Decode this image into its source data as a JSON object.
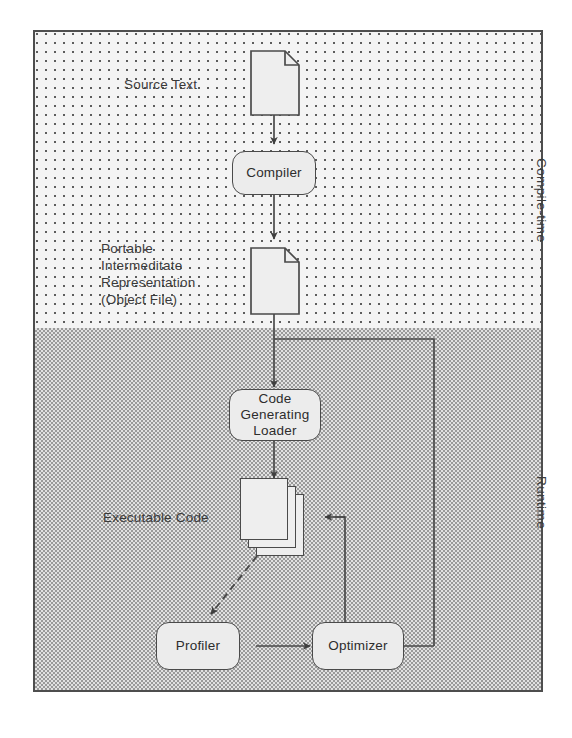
{
  "diagram": {
    "bands": [
      {
        "id": "compile",
        "label": "Compile-time",
        "fill": "#f4f4f4",
        "pattern": "sparse-dots"
      },
      {
        "id": "runtime",
        "label": "Runtime",
        "fill": "#c9c9c9",
        "pattern": "dense-checker"
      }
    ],
    "nodes": [
      {
        "id": "source-text",
        "label": "Source Text",
        "shape": "document"
      },
      {
        "id": "compiler",
        "label": "Compiler",
        "shape": "rounded-box"
      },
      {
        "id": "pir",
        "label": "Portable\nIntermeditate\nRepresentation\n(Object File)",
        "shape": "document"
      },
      {
        "id": "code-gen-loader",
        "label": "Code\nGenerating\nLoader",
        "shape": "rounded-box"
      },
      {
        "id": "executable-code",
        "label": "Executable Code",
        "shape": "page-stack"
      },
      {
        "id": "profiler",
        "label": "Profiler",
        "shape": "rounded-box"
      },
      {
        "id": "optimizer",
        "label": "Optimizer",
        "shape": "rounded-box"
      }
    ],
    "edges": [
      {
        "from": "source-text",
        "to": "compiler",
        "style": "solid"
      },
      {
        "from": "compiler",
        "to": "pir",
        "style": "solid"
      },
      {
        "from": "pir",
        "to": "code-gen-loader",
        "style": "solid"
      },
      {
        "from": "pir",
        "to": "optimizer",
        "style": "solid"
      },
      {
        "from": "code-gen-loader",
        "to": "executable-code",
        "style": "solid"
      },
      {
        "from": "executable-code",
        "to": "profiler",
        "style": "dashed"
      },
      {
        "from": "profiler",
        "to": "optimizer",
        "style": "solid"
      },
      {
        "from": "optimizer",
        "to": "executable-code",
        "style": "solid"
      }
    ],
    "colors": {
      "stroke": "#4a4a4a",
      "text": "#2f2f2f",
      "frame": "#4e4e4e",
      "node_fill": "#ececec"
    }
  }
}
